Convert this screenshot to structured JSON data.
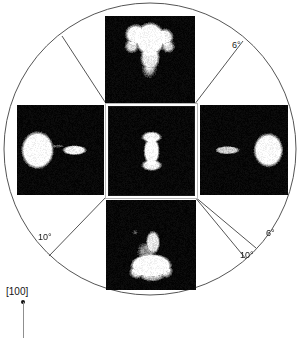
{
  "figure": {
    "background_color": "#ffffff",
    "line_color": "#555555",
    "panel_background": "#070707",
    "spot_color": "#ffffff",
    "circle": {
      "center_x": 150,
      "center_y": 149,
      "radius": 146
    },
    "direction_indicator": {
      "label": "[100]"
    },
    "angle_labels": [
      {
        "id": "top-right-6",
        "text": "6°",
        "x": 232,
        "y": 40
      },
      {
        "id": "bottom-right-6",
        "text": "6°",
        "x": 266,
        "y": 228
      },
      {
        "id": "bottom-right-10",
        "text": "10°",
        "x": 240,
        "y": 250
      },
      {
        "id": "bottom-left-10",
        "text": "10°",
        "x": 38,
        "y": 232
      }
    ],
    "sector_lines": [
      {
        "id": "upper-left-divider",
        "x1": 107,
        "y1": 105,
        "x2": 62,
        "y2": 36
      },
      {
        "id": "upper-right-divider",
        "x1": 194,
        "y1": 105,
        "x2": 243,
        "y2": 41
      },
      {
        "id": "lower-left-divider",
        "x1": 107,
        "y1": 196,
        "x2": 49,
        "y2": 256
      },
      {
        "id": "lower-right-divider-6",
        "x1": 194,
        "y1": 196,
        "x2": 256,
        "y2": 248
      },
      {
        "id": "lower-right-divider-10",
        "x1": 194,
        "y1": 196,
        "x2": 246,
        "y2": 259
      }
    ],
    "panels": [
      {
        "id": "panel-top",
        "name": "panel-top",
        "x": 105,
        "y": 16,
        "width": 90,
        "height": 88,
        "is_center": false,
        "description": "Branched tripod-shaped bright diffraction disc",
        "blobs": [
          {
            "cx": 0.5,
            "cy": 0.26,
            "rx": 0.155,
            "ry": 0.175,
            "i": 1.0,
            "blur": 3
          },
          {
            "cx": 0.34,
            "cy": 0.21,
            "rx": 0.105,
            "ry": 0.105,
            "i": 0.98,
            "blur": 3
          },
          {
            "cx": 0.66,
            "cy": 0.24,
            "rx": 0.085,
            "ry": 0.085,
            "i": 0.95,
            "blur": 3
          },
          {
            "cx": 0.295,
            "cy": 0.34,
            "rx": 0.065,
            "ry": 0.065,
            "i": 0.85,
            "blur": 3
          },
          {
            "cx": 0.7,
            "cy": 0.345,
            "rx": 0.06,
            "ry": 0.058,
            "i": 0.85,
            "blur": 3
          },
          {
            "cx": 0.5,
            "cy": 0.47,
            "rx": 0.095,
            "ry": 0.135,
            "i": 0.92,
            "blur": 4
          },
          {
            "cx": 0.49,
            "cy": 0.6,
            "rx": 0.06,
            "ry": 0.075,
            "i": 0.7,
            "blur": 5
          },
          {
            "cx": 0.51,
            "cy": 0.38,
            "rx": 0.07,
            "ry": 0.055,
            "i": 0.35,
            "blur": 3
          }
        ]
      },
      {
        "id": "panel-left",
        "name": "panel-left",
        "x": 17,
        "y": 105,
        "width": 87,
        "height": 90,
        "is_center": false,
        "description": "Large round disc at left with elongated streak to its right",
        "blobs": [
          {
            "cx": 0.235,
            "cy": 0.5,
            "rx": 0.175,
            "ry": 0.195,
            "i": 1.0,
            "blur": 3
          },
          {
            "cx": 0.66,
            "cy": 0.5,
            "rx": 0.125,
            "ry": 0.048,
            "i": 0.95,
            "blur": 3
          },
          {
            "cx": 0.455,
            "cy": 0.455,
            "rx": 0.07,
            "ry": 0.016,
            "i": 0.35,
            "blur": 3
          }
        ]
      },
      {
        "id": "panel-center",
        "name": "panel-center",
        "x": 108,
        "y": 106,
        "width": 85,
        "height": 88,
        "is_center": true,
        "description": "Small hourglass-shaped bright disc at pattern center",
        "blobs": [
          {
            "cx": 0.5,
            "cy": 0.5,
            "rx": 0.085,
            "ry": 0.145,
            "i": 1.0,
            "blur": 3
          },
          {
            "cx": 0.5,
            "cy": 0.34,
            "rx": 0.105,
            "ry": 0.055,
            "i": 0.95,
            "blur": 3
          },
          {
            "cx": 0.5,
            "cy": 0.66,
            "rx": 0.105,
            "ry": 0.055,
            "i": 0.95,
            "blur": 3
          },
          {
            "cx": 0.5,
            "cy": 0.5,
            "rx": 0.05,
            "ry": 0.05,
            "i": 0.6,
            "blur": 3
          }
        ]
      },
      {
        "id": "panel-right",
        "name": "panel-right",
        "x": 200,
        "y": 105,
        "width": 88,
        "height": 90,
        "is_center": false,
        "description": "Elongated streak at left with large round disc to its right",
        "blobs": [
          {
            "cx": 0.775,
            "cy": 0.5,
            "rx": 0.155,
            "ry": 0.175,
            "i": 1.0,
            "blur": 3
          },
          {
            "cx": 0.31,
            "cy": 0.5,
            "rx": 0.125,
            "ry": 0.04,
            "i": 0.8,
            "blur": 3
          },
          {
            "cx": 0.34,
            "cy": 0.485,
            "rx": 0.08,
            "ry": 0.018,
            "i": 0.45,
            "blur": 3
          }
        ]
      },
      {
        "id": "panel-bottom",
        "name": "panel-bottom",
        "x": 106,
        "y": 200,
        "width": 90,
        "height": 90,
        "is_center": false,
        "description": "Fan or bell shaped bright disc with vertical tail above",
        "blobs": [
          {
            "cx": 0.5,
            "cy": 0.73,
            "rx": 0.215,
            "ry": 0.125,
            "i": 1.0,
            "blur": 3
          },
          {
            "cx": 0.52,
            "cy": 0.47,
            "rx": 0.07,
            "ry": 0.115,
            "i": 0.9,
            "blur": 3
          },
          {
            "cx": 0.45,
            "cy": 0.57,
            "rx": 0.085,
            "ry": 0.085,
            "i": 0.55,
            "blur": 4
          },
          {
            "cx": 0.34,
            "cy": 0.8,
            "rx": 0.07,
            "ry": 0.06,
            "i": 0.85,
            "blur": 3
          },
          {
            "cx": 0.66,
            "cy": 0.79,
            "rx": 0.065,
            "ry": 0.06,
            "i": 0.8,
            "blur": 3
          },
          {
            "cx": 0.51,
            "cy": 0.84,
            "rx": 0.12,
            "ry": 0.055,
            "i": 0.7,
            "blur": 4
          },
          {
            "cx": 0.32,
            "cy": 0.36,
            "rx": 0.018,
            "ry": 0.018,
            "i": 0.4,
            "blur": 2
          }
        ]
      }
    ]
  }
}
